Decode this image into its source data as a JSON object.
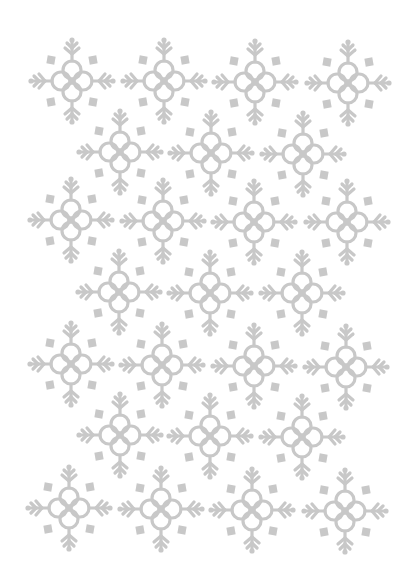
{
  "pattern": {
    "description": "Grid of ornamental snowflake motifs",
    "color": "#c8c8c8",
    "background": "#ffffff",
    "flakes": [
      {
        "x": 72,
        "y": 81
      },
      {
        "x": 164,
        "y": 81
      },
      {
        "x": 255,
        "y": 82
      },
      {
        "x": 348,
        "y": 83
      },
      {
        "x": 120,
        "y": 152
      },
      {
        "x": 211,
        "y": 153
      },
      {
        "x": 303,
        "y": 154
      },
      {
        "x": 71,
        "y": 220
      },
      {
        "x": 163,
        "y": 221
      },
      {
        "x": 254,
        "y": 222
      },
      {
        "x": 347,
        "y": 222
      },
      {
        "x": 119,
        "y": 292
      },
      {
        "x": 210,
        "y": 293
      },
      {
        "x": 302,
        "y": 293
      },
      {
        "x": 71,
        "y": 364
      },
      {
        "x": 162,
        "y": 365
      },
      {
        "x": 254,
        "y": 366
      },
      {
        "x": 346,
        "y": 367
      },
      {
        "x": 120,
        "y": 435
      },
      {
        "x": 210,
        "y": 436
      },
      {
        "x": 302,
        "y": 437
      },
      {
        "x": 69,
        "y": 508
      },
      {
        "x": 161,
        "y": 509
      },
      {
        "x": 252,
        "y": 510
      },
      {
        "x": 345,
        "y": 511
      }
    ]
  }
}
